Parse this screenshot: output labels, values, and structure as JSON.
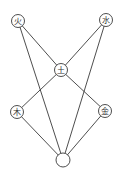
{
  "diagram": {
    "type": "graph",
    "nodes": [
      {
        "id": "fire",
        "label": "火"
      },
      {
        "id": "water",
        "label": "水"
      },
      {
        "id": "earth",
        "label": "土"
      },
      {
        "id": "wood",
        "label": "木"
      },
      {
        "id": "metal",
        "label": "金"
      },
      {
        "id": "center-bottom",
        "label": ""
      }
    ],
    "edges": [
      {
        "from": "fire",
        "to": "earth"
      },
      {
        "from": "water",
        "to": "earth"
      },
      {
        "from": "fire",
        "to": "center-bottom"
      },
      {
        "from": "water",
        "to": "center-bottom"
      },
      {
        "from": "earth",
        "to": "wood"
      },
      {
        "from": "earth",
        "to": "metal"
      },
      {
        "from": "wood",
        "to": "center-bottom"
      },
      {
        "from": "metal",
        "to": "center-bottom"
      }
    ],
    "colors": {
      "line": "#3a3a3a",
      "background": "#ffffff"
    }
  }
}
